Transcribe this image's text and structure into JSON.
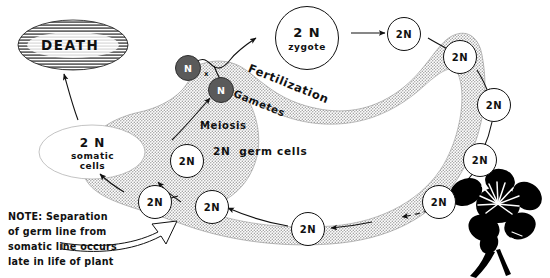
{
  "diagram": {
    "colors": {
      "ink": "#111111",
      "band_fill": "#d8d8d8",
      "gamete_fill": "#5a5a5a",
      "flower_fill": "#000000",
      "background": "#ffffff"
    },
    "death": {
      "label": "DEATH"
    },
    "zygote": {
      "ploidy": "2 N",
      "name": "zygote"
    },
    "somatic": {
      "ploidy": "2 N",
      "line1": "somatic",
      "line2": "cells"
    },
    "germ_cells_label": "2N  germ cells",
    "meiosis_label": "Meiosis",
    "fertilization_label": "Fertilization",
    "gametes_label": "Gametes",
    "cross_symbol": "x",
    "gametes": [
      {
        "label": "N"
      },
      {
        "label": "N"
      }
    ],
    "cells": [
      {
        "label": "2N"
      },
      {
        "label": "2N"
      },
      {
        "label": "2N"
      },
      {
        "label": "2N"
      },
      {
        "label": "2N"
      },
      {
        "label": "2N"
      },
      {
        "label": "2N"
      },
      {
        "label": "2N"
      },
      {
        "label": "2N"
      }
    ],
    "note": {
      "line1": "NOTE: Separation",
      "line2": "of germ line from",
      "line3": "somatic line occurs",
      "line4": "late in life of plant"
    },
    "flower": {
      "name": "flower-silhouette"
    }
  }
}
